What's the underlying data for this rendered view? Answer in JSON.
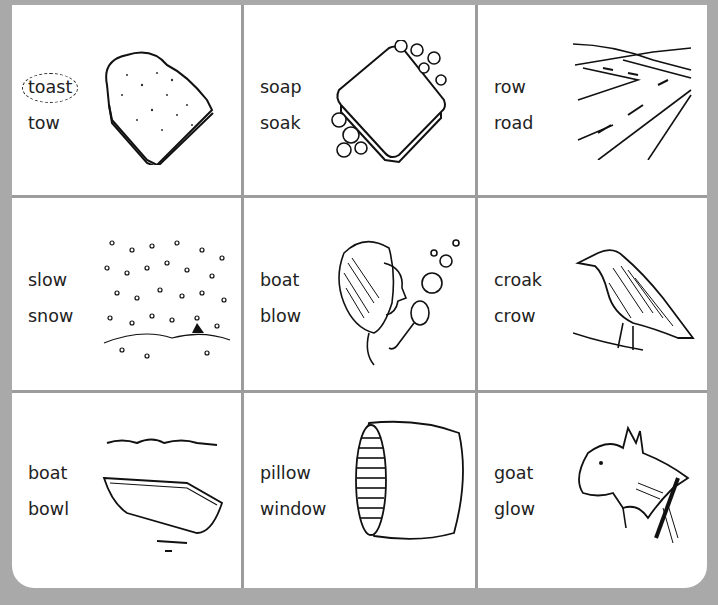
{
  "worksheet": {
    "instructions_visible": false,
    "cells": [
      {
        "words": [
          "toast",
          "tow"
        ],
        "circled": "toast",
        "picture": "toast"
      },
      {
        "words": [
          "soap",
          "soak"
        ],
        "circled": null,
        "picture": "soap"
      },
      {
        "words": [
          "row",
          "road"
        ],
        "circled": null,
        "picture": "road"
      },
      {
        "words": [
          "slow",
          "snow"
        ],
        "circled": null,
        "picture": "snow"
      },
      {
        "words": [
          "boat",
          "blow"
        ],
        "circled": null,
        "picture": "girl-blowing-bubbles"
      },
      {
        "words": [
          "croak",
          "crow"
        ],
        "circled": null,
        "picture": "crow"
      },
      {
        "words": [
          "boat",
          "bowl"
        ],
        "circled": null,
        "picture": "boat"
      },
      {
        "words": [
          "pillow",
          "window"
        ],
        "circled": null,
        "picture": "pillow"
      },
      {
        "words": [
          "goat",
          "glow"
        ],
        "circled": null,
        "picture": "goat"
      }
    ]
  },
  "colors": {
    "background": "#a9a9a9",
    "panel": "#ffffff",
    "divider": "#9c9c9c",
    "ink": "#222222"
  }
}
